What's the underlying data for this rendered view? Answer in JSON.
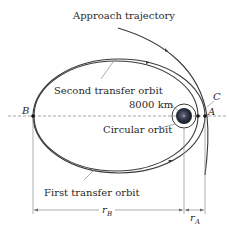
{
  "diagram": {
    "labels": {
      "approach": "Approach trajectory",
      "second_transfer": "Second transfer orbit",
      "first_transfer": "First transfer orbit",
      "circular": "Circular orbit",
      "altitude": "8000 km"
    },
    "points": {
      "A": "A",
      "B": "B",
      "C": "C"
    },
    "dimensions": {
      "rB_var": "r",
      "rB_sub": "B",
      "rA_var": "r",
      "rA_sub": "A"
    },
    "colors": {
      "line": "#3a3a3a",
      "planet": "#2b3140",
      "dashed": "#9a9a9a",
      "leader": "#8a8a8a"
    }
  }
}
